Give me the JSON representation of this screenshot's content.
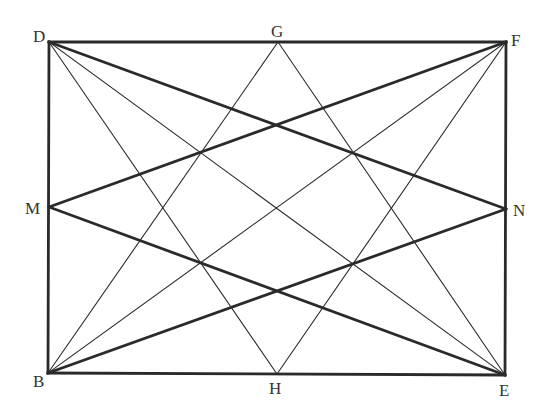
{
  "diagram": {
    "title": "",
    "points": {
      "D": {
        "x": 49,
        "y": 42
      },
      "G": {
        "x": 278,
        "y": 42
      },
      "F": {
        "x": 506,
        "y": 42
      },
      "M": {
        "x": 49,
        "y": 207
      },
      "N": {
        "x": 506,
        "y": 209
      },
      "B": {
        "x": 48,
        "y": 373
      },
      "H": {
        "x": 277,
        "y": 374
      },
      "E": {
        "x": 505,
        "y": 375
      }
    },
    "labels": [
      {
        "text": "D",
        "x": 33,
        "y": 28
      },
      {
        "text": "G",
        "x": 271,
        "y": 23
      },
      {
        "text": "F",
        "x": 511,
        "y": 32
      },
      {
        "text": "M",
        "x": 25,
        "y": 200
      },
      {
        "text": "N",
        "x": 513,
        "y": 202
      },
      {
        "text": "B",
        "x": 33,
        "y": 373
      },
      {
        "text": "H",
        "x": 269,
        "y": 380
      },
      {
        "text": "E",
        "x": 499,
        "y": 382
      }
    ],
    "thick_segments": [
      [
        "D",
        "F"
      ],
      [
        "F",
        "E"
      ],
      [
        "E",
        "B"
      ],
      [
        "B",
        "D"
      ],
      [
        "D",
        "N"
      ],
      [
        "M",
        "F"
      ],
      [
        "M",
        "E"
      ],
      [
        "B",
        "N"
      ]
    ],
    "thin_segments": [
      [
        "D",
        "H"
      ],
      [
        "D",
        "E"
      ],
      [
        "G",
        "B"
      ],
      [
        "G",
        "E"
      ],
      [
        "F",
        "B"
      ],
      [
        "F",
        "H"
      ]
    ],
    "colors": {
      "line": "#2a2a2a",
      "label": "#333333"
    }
  }
}
